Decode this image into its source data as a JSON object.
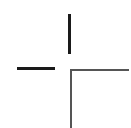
{
  "diagram": {
    "type": "crosshair-offset-lines",
    "segments": [
      {
        "name": "top-vertical",
        "x": 68,
        "y": 14,
        "w": 3,
        "h": 40,
        "color": "#1a1a1a"
      },
      {
        "name": "left-horizontal",
        "x": 17,
        "y": 67,
        "w": 38,
        "h": 3,
        "color": "#1a1a1a"
      },
      {
        "name": "right-horizontal",
        "x": 70,
        "y": 69,
        "w": 59,
        "h": 2,
        "color": "#555555"
      },
      {
        "name": "bottom-vertical",
        "x": 70,
        "y": 69,
        "w": 2,
        "h": 59,
        "color": "#555555"
      }
    ]
  }
}
